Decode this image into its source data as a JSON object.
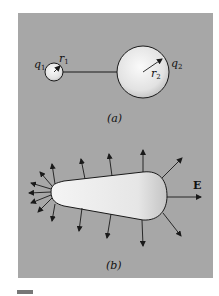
{
  "figure": {
    "panel_a": {
      "caption": "(a)",
      "small_sphere": {
        "charge_label": "q",
        "charge_sub": "1",
        "radius_label": "r",
        "radius_sub": "1"
      },
      "large_sphere": {
        "charge_label": "q",
        "charge_sub": "2",
        "radius_label": "r",
        "radius_sub": "2"
      },
      "connector": "conducting wire"
    },
    "panel_b": {
      "caption": "(b)",
      "field_label": "E",
      "shape": "teardrop conductor with field lines normal to surface"
    },
    "colors": {
      "background": "#a7a7a7",
      "conductor_fill_light": "#f2f2f2",
      "conductor_fill_dark": "#c8c8c8",
      "line": "#1a1a1a"
    }
  }
}
